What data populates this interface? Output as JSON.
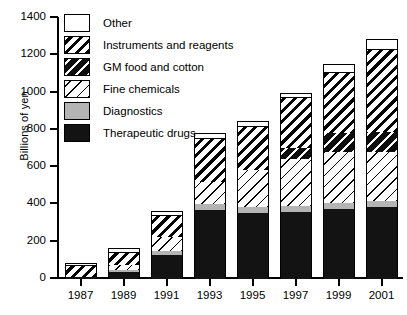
{
  "chart_data": {
    "type": "bar",
    "stacked": true,
    "title": "",
    "xlabel": "",
    "ylabel": "Billions of yen",
    "ylim": [
      0,
      1400
    ],
    "ytick_step": 200,
    "yticks": [
      0,
      200,
      400,
      600,
      800,
      1000,
      1200,
      1400
    ],
    "grid": false,
    "legend_position": "top-left-inside",
    "categories": [
      "1987",
      "1989",
      "1991",
      "1993",
      "1995",
      "1997",
      "1999",
      "2001"
    ],
    "series": [
      {
        "name": "Therapeutic drugs",
        "pattern": "solid-black",
        "values": [
          10,
          35,
          130,
          370,
          355,
          360,
          375,
          385
        ]
      },
      {
        "name": "Diagnostics",
        "pattern": "solid-gray",
        "values": [
          3,
          12,
          22,
          30,
          32,
          33,
          35,
          35
        ]
      },
      {
        "name": "Fine chemicals",
        "pattern": "fine-diagonal-white",
        "values": [
          0,
          30,
          75,
          120,
          200,
          250,
          270,
          260
        ]
      },
      {
        "name": "GM food and cotton",
        "pattern": "black-white-slash",
        "values": [
          0,
          0,
          0,
          0,
          0,
          60,
          105,
          110
        ]
      },
      {
        "name": "Instruments and reagents",
        "pattern": "bold-diagonal-white",
        "values": [
          57,
          65,
          110,
          230,
          230,
          270,
          320,
          440
        ]
      },
      {
        "name": "Other",
        "pattern": "white",
        "values": [
          10,
          18,
          23,
          30,
          23,
          22,
          45,
          50
        ]
      }
    ],
    "totals": [
      80,
      160,
      360,
      780,
      840,
      995,
      1150,
      1280
    ]
  },
  "axes": {
    "y_title": "Billions of yen",
    "y_labels": [
      "1400",
      "1200",
      "1000",
      "800",
      "600",
      "400",
      "200",
      "0"
    ],
    "x_labels": [
      "1987",
      "1989",
      "1991",
      "1993",
      "1995",
      "1997",
      "1999",
      "2001"
    ]
  },
  "legend": {
    "items": [
      {
        "label": "Other",
        "swatch": "white-swatch"
      },
      {
        "label": "Instruments and reagents",
        "swatch": "bold-diagonal-hatch-swatch"
      },
      {
        "label": "GM food and cotton",
        "swatch": "black-slash-swatch"
      },
      {
        "label": "Fine chemicals",
        "swatch": "fine-diagonal-hatch-swatch"
      },
      {
        "label": "Diagnostics",
        "swatch": "gray-swatch"
      },
      {
        "label": "Therapeutic drugs",
        "swatch": "black-swatch"
      }
    ]
  },
  "colors": {
    "axis": "#000000",
    "gray_fill": "#b4b4b4",
    "black_fill": "#131313",
    "white_fill": "#ffffff"
  }
}
